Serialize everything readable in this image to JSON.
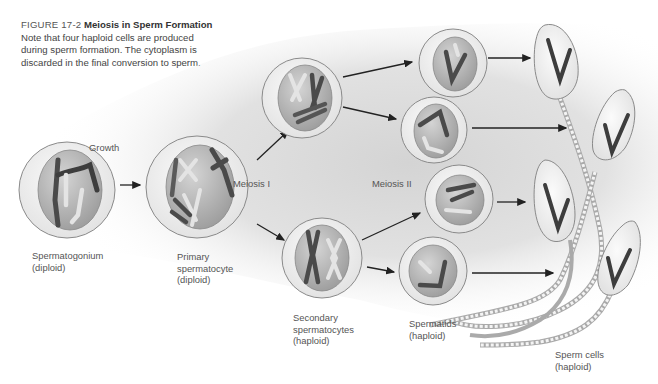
{
  "figure": {
    "number": "FIGURE 17-2",
    "title": "Meiosis in Sperm Formation",
    "caption": "Note that four haploid cells are produced during sperm formation. The cytoplasm is discarded in the final conversion to sperm."
  },
  "stages": {
    "growth": "Growth",
    "meiosis_1": "Meiosis I",
    "meiosis_2": "Meiosis II"
  },
  "cells": {
    "spermatogonium": {
      "name": "Spermatogonium",
      "ploidy": "(diploid)"
    },
    "primary": {
      "name_line1": "Primary",
      "name_line2": "spermatocyte",
      "ploidy": "(diploid)"
    },
    "secondary": {
      "name_line1": "Secondary",
      "name_line2": "spermatocytes",
      "ploidy": "(haploid)"
    },
    "spermatids": {
      "name": "Spermatids",
      "ploidy": "(haploid)"
    },
    "sperm": {
      "name": "Sperm cells",
      "ploidy": "(haploid)"
    }
  },
  "colors": {
    "cell_rim": "#f2f2f2",
    "cell_outline": "#8a8a8a",
    "nucleus": "#b9b9b9",
    "chromosome_dark": "#4a4a4a",
    "chromosome_light": "#e4e4e4",
    "arrow": "#222222",
    "background_glow": "#d6d6d6"
  }
}
